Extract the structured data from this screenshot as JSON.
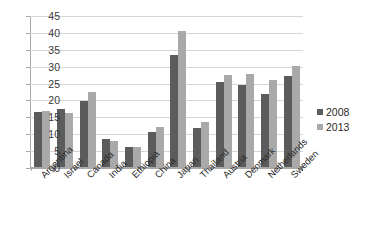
{
  "chart_data": {
    "type": "bar",
    "title": "",
    "xlabel": "",
    "ylabel": "",
    "ylim": [
      0,
      45
    ],
    "ytick_step": 5,
    "yticks": [
      "45",
      "40",
      "35",
      "30",
      "25",
      "20",
      "15",
      "10",
      "5",
      "0"
    ],
    "grid": true,
    "legend_position": "right",
    "categories": [
      "Argentina",
      "Israel",
      "Canada",
      "India",
      "Ethiopia",
      "China",
      "Japan",
      "Thailand",
      "Austria",
      "Denmark",
      "Netherlands",
      "Sweden"
    ],
    "series": [
      {
        "name": "2008",
        "color": "#5c5c5c",
        "values": [
          16.2,
          17.2,
          19.6,
          8.2,
          6.0,
          10.4,
          33.1,
          11.6,
          25.2,
          24.2,
          21.7,
          26.9
        ]
      },
      {
        "name": "2013",
        "color": "#a9a9a9",
        "values": [
          16.6,
          16.1,
          22.1,
          7.7,
          5.9,
          11.8,
          40.4,
          13.2,
          27.2,
          27.6,
          25.7,
          29.8
        ]
      }
    ]
  },
  "legend": {
    "items": [
      {
        "label": "2008"
      },
      {
        "label": "2013"
      }
    ]
  }
}
